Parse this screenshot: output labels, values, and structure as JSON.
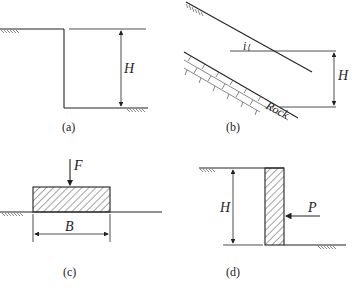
{
  "figure": {
    "panels": [
      {
        "id": "a",
        "caption": "(a)",
        "description": "Vertical cut in soil",
        "labels": {
          "height": "H"
        }
      },
      {
        "id": "b",
        "caption": "(b)",
        "description": "Infinite slope over rock layer",
        "labels": {
          "angle": "i",
          "height": "H",
          "rock": "Rock"
        }
      },
      {
        "id": "c",
        "caption": "(c)",
        "description": "Strip footing on ground surface",
        "labels": {
          "force": "F",
          "width": "B"
        }
      },
      {
        "id": "d",
        "caption": "(d)",
        "description": "Retaining wall with lateral force",
        "labels": {
          "height": "H",
          "force": "P"
        }
      }
    ]
  },
  "colors": {
    "line": "#222222",
    "background": "#ffffff",
    "hatch": "#555555"
  }
}
